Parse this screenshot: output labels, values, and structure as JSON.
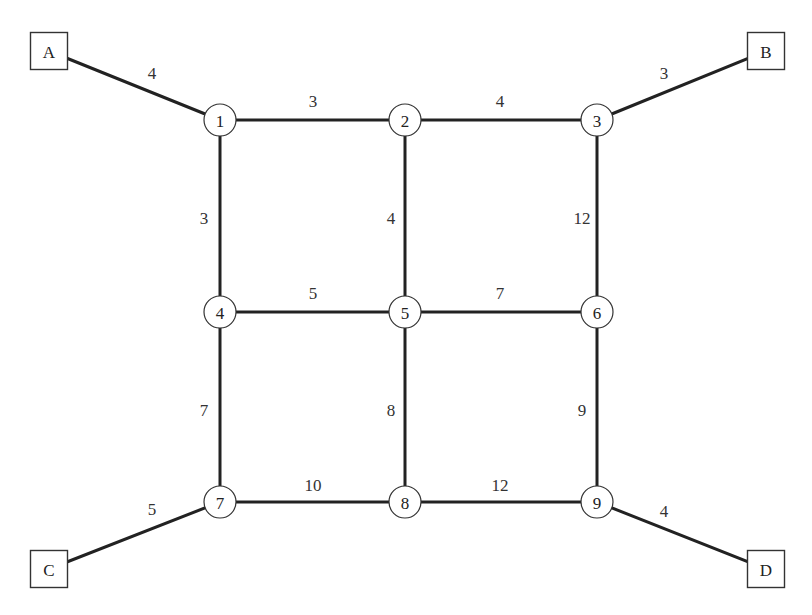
{
  "diagram": {
    "type": "weighted-network-graph",
    "header_cropped": true,
    "terminals": [
      {
        "id": "A",
        "label": "A",
        "x": 49,
        "y": 51
      },
      {
        "id": "B",
        "label": "B",
        "x": 766,
        "y": 51
      },
      {
        "id": "C",
        "label": "C",
        "x": 49,
        "y": 569
      },
      {
        "id": "D",
        "label": "D",
        "x": 766,
        "y": 569
      }
    ],
    "nodes": [
      {
        "id": "1",
        "label": "1",
        "x": 220,
        "y": 120
      },
      {
        "id": "2",
        "label": "2",
        "x": 405,
        "y": 120
      },
      {
        "id": "3",
        "label": "3",
        "x": 597,
        "y": 120
      },
      {
        "id": "4",
        "label": "4",
        "x": 220,
        "y": 312
      },
      {
        "id": "5",
        "label": "5",
        "x": 405,
        "y": 312
      },
      {
        "id": "6",
        "label": "6",
        "x": 597,
        "y": 312
      },
      {
        "id": "7",
        "label": "7",
        "x": 220,
        "y": 502
      },
      {
        "id": "8",
        "label": "8",
        "x": 405,
        "y": 502
      },
      {
        "id": "9",
        "label": "9",
        "x": 597,
        "y": 502
      }
    ],
    "edges": [
      {
        "from": "A",
        "to": "1",
        "weight": "4",
        "lx": 152,
        "ly": 73
      },
      {
        "from": "B",
        "to": "3",
        "weight": "3",
        "lx": 664,
        "ly": 73
      },
      {
        "from": "C",
        "to": "7",
        "weight": "5",
        "lx": 152,
        "ly": 509
      },
      {
        "from": "D",
        "to": "9",
        "weight": "4",
        "lx": 664,
        "ly": 511
      },
      {
        "from": "1",
        "to": "2",
        "weight": "3",
        "lx": 313,
        "ly": 101
      },
      {
        "from": "2",
        "to": "3",
        "weight": "4",
        "lx": 500,
        "ly": 101
      },
      {
        "from": "1",
        "to": "4",
        "weight": "3",
        "lx": 204,
        "ly": 218
      },
      {
        "from": "2",
        "to": "5",
        "weight": "4",
        "lx": 391,
        "ly": 218
      },
      {
        "from": "3",
        "to": "6",
        "weight": "12",
        "lx": 582,
        "ly": 218
      },
      {
        "from": "4",
        "to": "5",
        "weight": "5",
        "lx": 313,
        "ly": 293
      },
      {
        "from": "5",
        "to": "6",
        "weight": "7",
        "lx": 500,
        "ly": 293
      },
      {
        "from": "4",
        "to": "7",
        "weight": "7",
        "lx": 204,
        "ly": 410
      },
      {
        "from": "5",
        "to": "8",
        "weight": "8",
        "lx": 391,
        "ly": 410
      },
      {
        "from": "6",
        "to": "9",
        "weight": "9",
        "lx": 582,
        "ly": 410
      },
      {
        "from": "7",
        "to": "8",
        "weight": "10",
        "lx": 313,
        "ly": 485
      },
      {
        "from": "8",
        "to": "9",
        "weight": "12",
        "lx": 500,
        "ly": 485
      }
    ]
  }
}
